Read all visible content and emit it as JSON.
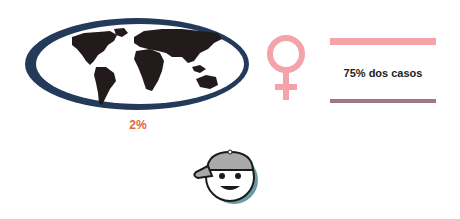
{
  "world": {
    "icon": "world-map-icon",
    "stat_label": "2%",
    "colors": {
      "ring": "#233a5a",
      "continents": "#231a1c",
      "label": "#e8623a"
    }
  },
  "female": {
    "icon": "female-symbol-icon",
    "stat_label": "75% dos casos",
    "colors": {
      "symbol": "#f4a3a8",
      "bar_top": "#f4a3a8",
      "bar_bottom": "#a4748a",
      "label": "#222222"
    }
  },
  "child": {
    "icon": "boy-with-cap-icon",
    "colors": {
      "cap": "#a9a9a9",
      "face": "#ffffff",
      "outline": "#1a1a1a",
      "shadow": "#6a9aa5"
    }
  }
}
